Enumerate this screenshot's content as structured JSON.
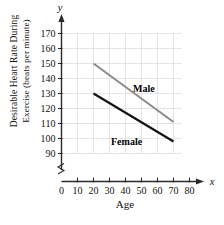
{
  "chart_data": {
    "type": "line",
    "title": "",
    "subtitle": "",
    "xlabel": "Age",
    "ylabel_line1": "Desirable Heart Rate During",
    "ylabel_line2": "Exercise (beats per minute)",
    "x_axis_variable": "x",
    "y_axis_variable": "y",
    "xlim": [
      0,
      85
    ],
    "ylim": [
      85,
      175
    ],
    "y_axis_break": true,
    "grid": true,
    "grid_color": "#e2e2e2",
    "legend_position": "inline-annotation",
    "xticks": [
      0,
      10,
      20,
      30,
      40,
      50,
      60,
      70,
      80
    ],
    "xtick_labels": [
      "0",
      "10",
      "20",
      "30",
      "40",
      "50",
      "60",
      "70",
      "80"
    ],
    "yticks": [
      90,
      100,
      110,
      120,
      130,
      140,
      150,
      160,
      170
    ],
    "ytick_labels": [
      "90",
      "100",
      "110",
      "120",
      "130",
      "140",
      "150",
      "160",
      "170"
    ],
    "series": [
      {
        "name": "Male",
        "label": "Male",
        "color": "#8c8c8c",
        "x": [
          20,
          70
        ],
        "values": [
          150,
          111
        ]
      },
      {
        "name": "Female",
        "label": "Female",
        "color": "#111111",
        "x": [
          20,
          70
        ],
        "values": [
          130,
          98
        ]
      }
    ]
  },
  "figure": {
    "caption": ""
  }
}
